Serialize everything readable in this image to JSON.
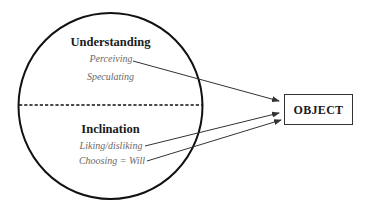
{
  "diagram": {
    "colors": {
      "stroke": "#111111",
      "arrow": "#333333",
      "heading_text": "#1a1a1a",
      "item_text": "#6a6a6a",
      "background": "#ffffff"
    },
    "circle": {
      "upper_section": {
        "heading": "Understanding",
        "items": [
          "Perceiving",
          "Speculating"
        ]
      },
      "lower_section": {
        "heading": "Inclination",
        "items": [
          "Liking/disliking",
          "Choosing = Will"
        ]
      }
    },
    "target": {
      "label": "OBJECT"
    },
    "arrows": [
      {
        "from": "Perceiving",
        "to": "OBJECT"
      },
      {
        "from": "Liking/disliking",
        "to": "OBJECT"
      },
      {
        "from": "Choosing = Will",
        "to": "OBJECT"
      }
    ]
  }
}
